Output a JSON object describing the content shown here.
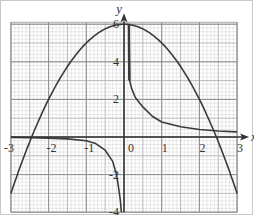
{
  "chart_data": {
    "type": "line",
    "title": "",
    "xlabel": "x",
    "ylabel": "y",
    "xlim": [
      -3,
      3
    ],
    "ylim": [
      -4,
      6
    ],
    "grid": true,
    "x_ticks": [
      "-3",
      "-2",
      "-1",
      "0",
      "1",
      "2",
      "3"
    ],
    "y_ticks": [
      "6",
      "4",
      "2",
      "-2",
      "-4"
    ],
    "series": [
      {
        "name": "parabola",
        "x": [
          -3,
          -2.5,
          -2,
          -1.5,
          -1,
          -0.5,
          0,
          0.5,
          1,
          1.5,
          2,
          2.5,
          3
        ],
        "y": [
          -3,
          -0.25,
          2,
          3.75,
          5,
          5.75,
          6,
          5.75,
          5,
          3.75,
          2,
          -0.25,
          -3
        ]
      },
      {
        "name": "reciprocal-right-branch",
        "x": [
          0.13,
          0.15,
          0.2,
          0.3,
          0.5,
          0.75,
          1,
          1.5,
          2,
          2.5,
          3
        ],
        "y": [
          6,
          3,
          2.6,
          2.1,
          1.6,
          1.1,
          0.8,
          0.55,
          0.4,
          0.32,
          0.27
        ]
      },
      {
        "name": "reciprocal-left-branch",
        "x": [
          -3,
          -2.5,
          -2,
          -1.5,
          -1,
          -0.75,
          -0.5,
          -0.3,
          -0.2,
          -0.15,
          -0.1,
          -0.07
        ],
        "y": [
          -0.02,
          -0.04,
          -0.06,
          -0.1,
          -0.2,
          -0.35,
          -0.7,
          -1.3,
          -2,
          -2.6,
          -3.3,
          -4
        ]
      }
    ]
  },
  "axes": {
    "x_label": "x",
    "y_label": "y",
    "x_tick_labels": [
      "-3",
      "-2",
      "-1",
      "0",
      "1",
      "2",
      "3"
    ],
    "y_tick_labels": [
      "6",
      "4",
      "2",
      "-2",
      "-4"
    ]
  }
}
